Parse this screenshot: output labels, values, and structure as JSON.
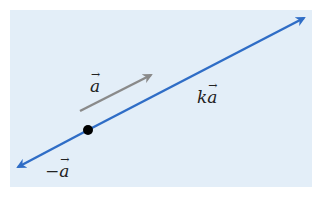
{
  "diagram": {
    "background_color": "#e3eef8",
    "line_color": "#2f6dc6",
    "vector_color": "#8a8a8a",
    "labels": {
      "vector_a": "a",
      "scaled_prefix": "k",
      "scaled_vector": "a",
      "negative_prefix": "−",
      "negative_vector": "a"
    },
    "elements": [
      {
        "type": "line",
        "name": "multiples of a",
        "label": "ka",
        "arrow_both_ends": true
      },
      {
        "type": "vector",
        "name": "a",
        "label": "a"
      },
      {
        "type": "point",
        "name": "origin"
      }
    ]
  }
}
